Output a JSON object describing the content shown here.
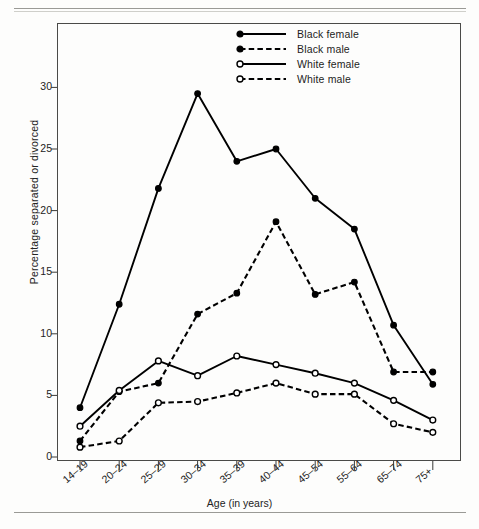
{
  "figure": {
    "y_axis_title": "Percentage separated or divorced",
    "x_axis_title": "Age (in years)"
  },
  "legend": {
    "items": [
      {
        "label": "Black female",
        "marker": "filled-circle",
        "line": "solid",
        "color": "#000000"
      },
      {
        "label": "Black male",
        "marker": "filled-circle",
        "line": "dashed",
        "color": "#000000"
      },
      {
        "label": "White female",
        "marker": "open-circle",
        "line": "solid",
        "color": "#000000"
      },
      {
        "label": "White male",
        "marker": "open-circle",
        "line": "dashed",
        "color": "#000000"
      }
    ]
  },
  "axes": {
    "y_ticks": [
      "0",
      "5",
      "10",
      "15",
      "20",
      "25",
      "30"
    ],
    "x_ticks": [
      "14–19",
      "20–24",
      "25–29",
      "30–34",
      "35–39",
      "40–44",
      "45–54",
      "55–64",
      "65–74",
      "75+"
    ]
  },
  "chart_data": {
    "type": "line",
    "title": "",
    "subtitle": "",
    "xlabel": "Age (in years)",
    "ylabel": "Percentage separated or divorced",
    "categories": [
      "14–19",
      "20–24",
      "25–29",
      "30–34",
      "35–39",
      "40–44",
      "45–54",
      "55–64",
      "65–74",
      "75+"
    ],
    "ylim": [
      0,
      32
    ],
    "ytick_values": [
      0,
      5,
      10,
      15,
      20,
      25,
      30
    ],
    "grid": false,
    "legend_position": "top-right-inside",
    "series": [
      {
        "name": "Black female",
        "line_style": "solid",
        "marker": "filled-circle",
        "color": "#000000",
        "values": [
          4.0,
          12.4,
          21.8,
          29.5,
          24.0,
          25.0,
          21.0,
          18.5,
          10.7,
          5.9
        ]
      },
      {
        "name": "Black male",
        "line_style": "dashed",
        "marker": "filled-circle",
        "color": "#000000",
        "values": [
          1.3,
          5.3,
          6.0,
          11.6,
          13.3,
          19.1,
          13.2,
          14.2,
          6.9,
          6.9
        ]
      },
      {
        "name": "White female",
        "line_style": "solid",
        "marker": "open-circle",
        "color": "#000000",
        "values": [
          2.5,
          5.4,
          7.8,
          6.6,
          8.2,
          7.5,
          6.8,
          6.0,
          4.6,
          3.0
        ]
      },
      {
        "name": "White male",
        "line_style": "dashed",
        "marker": "open-circle",
        "color": "#000000",
        "values": [
          0.8,
          1.3,
          4.4,
          4.5,
          5.2,
          6.0,
          5.1,
          5.1,
          2.7,
          2.0
        ]
      }
    ]
  }
}
